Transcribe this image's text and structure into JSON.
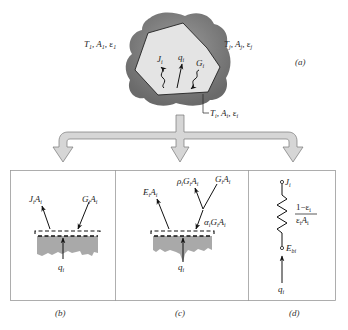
{
  "panel_a": {
    "label": "(a)",
    "surroundings_left": {
      "T": "T",
      "T_sub": "1",
      "A": "A",
      "A_sub": "1",
      "e": "ε",
      "e_sub": "1"
    },
    "surroundings_right": {
      "T": "T",
      "T_sub": "j",
      "A": "A",
      "A_sub": "j",
      "e": "ε",
      "e_sub": "j"
    },
    "surface_i": {
      "T": "T",
      "T_sub": "i",
      "A": "A",
      "A_sub": "i",
      "e": "ε",
      "e_sub": "i"
    },
    "arrows": [
      {
        "symbol": "J",
        "sub": "i",
        "meaning": "radiosity"
      },
      {
        "symbol": "q",
        "sub": "i",
        "meaning": "net radiation"
      },
      {
        "symbol": "G",
        "sub": "i",
        "meaning": "irradiation"
      }
    ]
  },
  "panel_b": {
    "label": "(b)",
    "outgoing": {
      "sym1": "J",
      "sub1": "i",
      "sym2": "A",
      "sub2": "i"
    },
    "incoming": {
      "sym1": "G",
      "sub1": "i",
      "sym2": "A",
      "sub2": "i"
    },
    "net": {
      "sym": "q",
      "sub": "i"
    }
  },
  "panel_c": {
    "label": "(c)",
    "emitted": {
      "sym1": "E",
      "sub1": "i",
      "sym2": "A",
      "sub2": "i"
    },
    "reflected": {
      "sym0": "ρ",
      "sub0": "i",
      "sym1": "G",
      "sub1": "i",
      "sym2": "A",
      "sub2": "i"
    },
    "incident": {
      "sym1": "G",
      "sub1": "i",
      "sym2": "A",
      "sub2": "i"
    },
    "absorbed": {
      "sym0": "α",
      "sub0": "i",
      "sym1": "G",
      "sub1": "i",
      "sym2": "A",
      "sub2": "i"
    },
    "net": {
      "sym": "q",
      "sub": "i"
    }
  },
  "panel_d": {
    "label": "(d)",
    "top_node": {
      "sym": "J",
      "sub": "i"
    },
    "bottom_node": {
      "sym": "E",
      "sub": "bi"
    },
    "resistance_num": "1−ε",
    "resistance_num_sub": "i",
    "resistance_den1": "ε",
    "resistance_den1_sub": "i",
    "resistance_den2": "A",
    "resistance_den2_sub": "i",
    "net": {
      "sym": "q",
      "sub": "i"
    }
  },
  "colors": {
    "surroundings": "#8a8a8a",
    "surroundings_dark": "#6e6e6e",
    "enclosure_fill": "#e2e2e2",
    "arrow_fill": "#d4d4d4",
    "solid_fill": "#a8a8a8",
    "frame": "#9a9a9a"
  }
}
